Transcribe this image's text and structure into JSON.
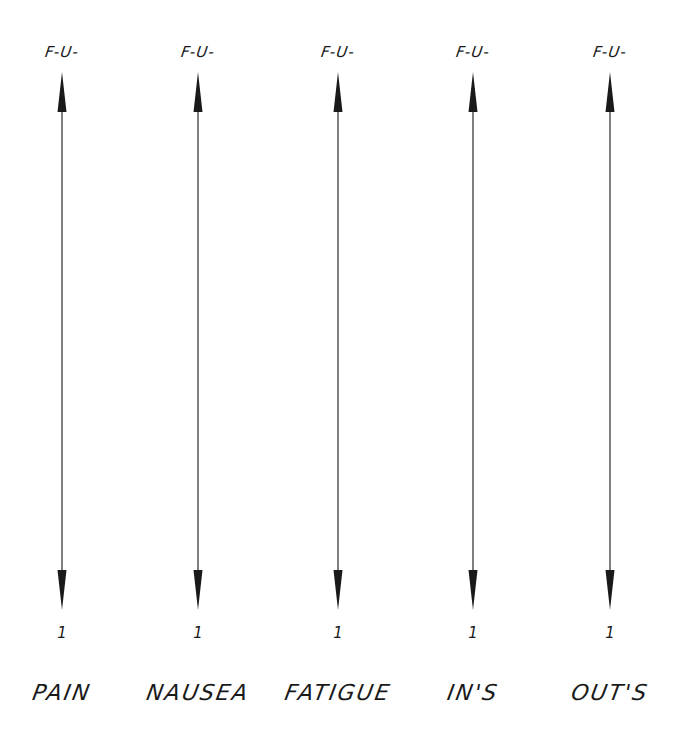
{
  "scales": [
    {
      "top_label": "F-U-",
      "bottom_value": "1",
      "category": "PAIN"
    },
    {
      "top_label": "F-U-",
      "bottom_value": "1",
      "category": "NAUSEA"
    },
    {
      "top_label": "F-U-",
      "bottom_value": "1",
      "category": "FATIGUE"
    },
    {
      "top_label": "F-U-",
      "bottom_value": "1",
      "category": "IN'S"
    },
    {
      "top_label": "F-U-",
      "bottom_value": "1",
      "category": "OUT'S"
    }
  ],
  "colors": {
    "ink": "#1a1a1a",
    "line": "#555555",
    "background": "#ffffff"
  }
}
